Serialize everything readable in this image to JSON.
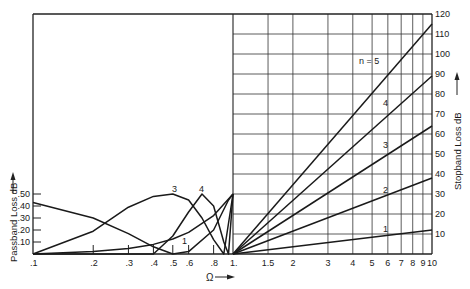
{
  "chart_data": {
    "type": "line",
    "title": "",
    "xlabel": "Ω",
    "ylabel_left": "Passband Loss dB",
    "ylabel_right": "Stopband Loss dB",
    "x_scale": "log",
    "x_passband_ticks": [
      ".1",
      ".2",
      ".3",
      ".4",
      ".5",
      ".6",
      ".8",
      "1."
    ],
    "x_passband_values": [
      0.1,
      0.2,
      0.3,
      0.4,
      0.5,
      0.6,
      0.8,
      1.0
    ],
    "x_stopband_ticks": [
      "1.5",
      "2",
      "3",
      "4",
      "5",
      "6",
      "7",
      "8",
      "9",
      "10"
    ],
    "x_stopband_values": [
      1.5,
      2,
      3,
      4,
      5,
      6,
      7,
      8,
      9,
      10
    ],
    "y_left_ticks": [
      ".10",
      ".20",
      ".30",
      ".40",
      ".50"
    ],
    "y_left_values": [
      0.1,
      0.2,
      0.3,
      0.4,
      0.5
    ],
    "y_left_range": [
      0,
      0.5
    ],
    "y_right_ticks": [
      "10",
      "20",
      "30",
      "40",
      "50",
      "60",
      "70",
      "80",
      "90",
      "100",
      "110",
      "120"
    ],
    "y_right_values": [
      10,
      20,
      30,
      40,
      50,
      60,
      70,
      80,
      90,
      100,
      110,
      120
    ],
    "y_right_range": [
      0,
      120
    ],
    "grid": "stopband region only",
    "stopband_series": [
      {
        "name": "n = 1",
        "label": "1",
        "x": [
          1,
          10
        ],
        "y": [
          0,
          12
        ]
      },
      {
        "name": "n = 2",
        "label": "2",
        "x": [
          1,
          10
        ],
        "y": [
          0,
          38
        ]
      },
      {
        "name": "n = 3",
        "label": "3",
        "x": [
          1,
          10
        ],
        "y": [
          0,
          64
        ]
      },
      {
        "name": "n = 4",
        "label": "4",
        "x": [
          1,
          10
        ],
        "y": [
          0,
          89
        ]
      },
      {
        "name": "n = 5",
        "label": "n = 5",
        "x": [
          1,
          10
        ],
        "y": [
          0,
          115
        ]
      }
    ],
    "passband_series": [
      {
        "name": "n = 1",
        "label": "1",
        "x": [
          0.1,
          0.2,
          0.3,
          0.4,
          0.5,
          0.6,
          0.8,
          1.0
        ],
        "y": [
          0.0,
          0.02,
          0.045,
          0.08,
          0.125,
          0.18,
          0.32,
          0.5
        ]
      },
      {
        "name": "n = 2",
        "label": "",
        "x": [
          0.1,
          0.2,
          0.3,
          0.4,
          0.5,
          0.6,
          0.8,
          0.95,
          1.0
        ],
        "y": [
          0.43,
          0.3,
          0.17,
          0.06,
          0.0,
          0.02,
          0.2,
          0.45,
          0.5
        ]
      },
      {
        "name": "n = 3",
        "label": "3",
        "x": [
          0.1,
          0.2,
          0.3,
          0.4,
          0.5,
          0.6,
          0.7,
          0.8,
          0.9,
          1.0
        ],
        "y": [
          0.0,
          0.19,
          0.39,
          0.48,
          0.5,
          0.45,
          0.3,
          0.12,
          0.0,
          0.5
        ]
      },
      {
        "name": "n = 4",
        "label": "4",
        "x": [
          0.1,
          0.3,
          0.4,
          0.5,
          0.6,
          0.7,
          0.8,
          0.9,
          0.95,
          1.0
        ],
        "y": [
          0.0,
          0.0,
          0.0,
          0.15,
          0.35,
          0.5,
          0.4,
          0.1,
          0.0,
          0.5
        ]
      }
    ]
  }
}
